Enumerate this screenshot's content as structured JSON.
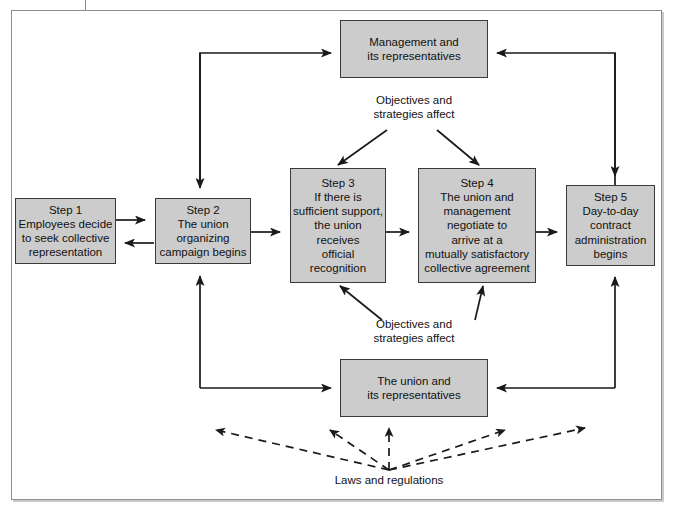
{
  "diagram": {
    "fill_color": "#cccccc",
    "stroke_color": "#3a3a3a",
    "frame_color": "#8e8e8e",
    "nodes": {
      "management": {
        "lines": [
          "Management and",
          "its representatives"
        ]
      },
      "step1": {
        "lines": [
          "Step 1",
          "Employees decide",
          "to seek collective",
          "representation"
        ]
      },
      "step2": {
        "lines": [
          "Step 2",
          "The union",
          "organizing",
          "campaign begins"
        ]
      },
      "step3": {
        "lines": [
          "Step 3",
          "If there is",
          "sufficient support,",
          "the union",
          "receives",
          "official",
          "recognition"
        ]
      },
      "step4": {
        "lines": [
          "Step 4",
          "The union and",
          "management",
          "negotiate to",
          "arrive at a",
          "mutually satisfactory",
          "collective agreement"
        ]
      },
      "step5": {
        "lines": [
          "Step 5",
          "Day-to-day",
          "contract",
          "administration",
          "begins"
        ]
      },
      "union": {
        "lines": [
          "The union and",
          "its representatives"
        ]
      }
    },
    "captions": {
      "objectives_top": {
        "lines": [
          "Objectives and",
          "strategies affect"
        ]
      },
      "objectives_bottom": {
        "lines": [
          "Objectives and",
          "strategies affect"
        ]
      },
      "laws": {
        "lines": [
          "Laws and regulations"
        ]
      }
    }
  }
}
